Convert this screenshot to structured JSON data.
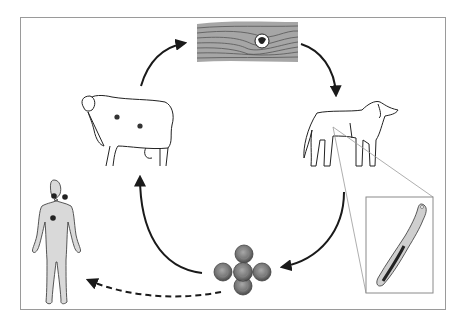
{
  "diagram": {
    "type": "life-cycle",
    "colors": {
      "frame": "#9a9a9a",
      "line": "#1a1a1a",
      "cyst_fill": "#7d7d7d",
      "human_fill": "#d9d9d9",
      "muscle_fill": "#9a9a9a",
      "inset_border": "#8a8a8a"
    },
    "nodes": [
      {
        "id": "muscle-tissue-cyst",
        "icon": "muscle-cyst-icon",
        "position": "top"
      },
      {
        "id": "dog",
        "icon": "dog-icon",
        "position": "right",
        "role": "definitive host"
      },
      {
        "id": "tapeworm-inset",
        "icon": "tapeworm-icon",
        "position": "bottom-right"
      },
      {
        "id": "eggs",
        "icon": "eggs-icon",
        "position": "bottom"
      },
      {
        "id": "sheep",
        "icon": "sheep-icon",
        "position": "left",
        "role": "intermediate host"
      },
      {
        "id": "human",
        "icon": "human-icon",
        "position": "far-left",
        "role": "accidental host"
      }
    ],
    "edges": [
      {
        "from": "sheep",
        "to": "muscle-tissue-cyst",
        "style": "solid"
      },
      {
        "from": "muscle-tissue-cyst",
        "to": "dog",
        "style": "solid"
      },
      {
        "from": "dog",
        "to": "eggs",
        "style": "solid"
      },
      {
        "from": "eggs",
        "to": "sheep",
        "style": "solid"
      },
      {
        "from": "eggs",
        "to": "human",
        "style": "dashed"
      }
    ],
    "caption": ""
  }
}
